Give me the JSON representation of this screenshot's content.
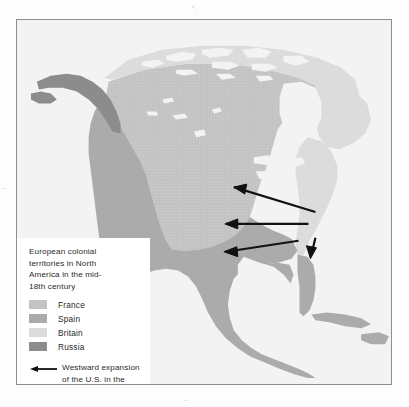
{
  "figure": {
    "kind": "historical-map",
    "region": "North America",
    "frame_border_color": "#8e8e8e",
    "ocean_color": "#f3f3f3",
    "page_background": "#fdfdfd"
  },
  "legend": {
    "caption": "European colonial\nterritories in North\nAmerica in the mid-\n18th century",
    "entries": [
      {
        "label": "France",
        "color": "#c3c3c3"
      },
      {
        "label": "Spain",
        "color": "#ababab"
      },
      {
        "label": "Britain",
        "color": "#dcdcdc"
      },
      {
        "label": "Russia",
        "color": "#8c8c8c"
      }
    ],
    "arrow_entry": {
      "icon": "left-arrow-icon",
      "text": "Westward expansion\nof the U.S. in the\n19th century",
      "color": "#111111"
    }
  },
  "map": {
    "territories": [
      {
        "name": "France",
        "color": "#c3c3c3"
      },
      {
        "name": "Spain",
        "color": "#ababab"
      },
      {
        "name": "Britain",
        "color": "#dcdcdc"
      },
      {
        "name": "Russia",
        "color": "#8c8c8c"
      }
    ],
    "arrows": [
      {
        "name": "expansion-arrow-north",
        "from_x": 300,
        "from_y": 193,
        "to_x": 218,
        "to_y": 168
      },
      {
        "name": "expansion-arrow-middle",
        "from_x": 293,
        "from_y": 205,
        "to_x": 211,
        "to_y": 205
      },
      {
        "name": "expansion-arrow-south",
        "from_x": 283,
        "from_y": 222,
        "to_x": 210,
        "to_y": 233
      },
      {
        "name": "expansion-arrow-florida",
        "from_x": 300,
        "from_y": 222,
        "to_x": 296,
        "to_y": 240
      }
    ],
    "arrow_color": "#111111"
  }
}
